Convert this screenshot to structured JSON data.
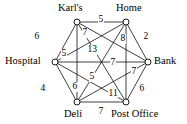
{
  "diagram": {
    "type": "weighted-graph",
    "vertex_count": 6,
    "edge_count": 15,
    "colors": {
      "background": "#ffffff",
      "stroke": "#000000",
      "vertex_fill": "#ffffff",
      "text": "#000000"
    },
    "nodes": [
      {
        "id": "karls",
        "label": "Karl's",
        "cx": 77,
        "cy": 22,
        "label_x": 58,
        "label_y": 3,
        "label_anchor": "left"
      },
      {
        "id": "home",
        "label": "Home",
        "cx": 126,
        "cy": 22,
        "label_x": 116,
        "label_y": 3,
        "label_anchor": "left"
      },
      {
        "id": "hospital",
        "label": "Hospital",
        "cx": 55,
        "cy": 62,
        "label_x": 5,
        "label_y": 56,
        "label_anchor": "left"
      },
      {
        "id": "bank",
        "label": "Bank",
        "cx": 148,
        "cy": 62,
        "label_x": 154,
        "label_y": 56,
        "label_anchor": "left"
      },
      {
        "id": "deli",
        "label": "Deli",
        "cx": 77,
        "cy": 102,
        "label_x": 64,
        "label_y": 109,
        "label_anchor": "left"
      },
      {
        "id": "postoffice",
        "label": "Post Office",
        "cx": 126,
        "cy": 102,
        "label_x": 111,
        "label_y": 109,
        "label_anchor": "left"
      }
    ],
    "edges": [
      {
        "id": "karls-home",
        "from": "karls",
        "to": "home",
        "weight": "5",
        "label_x": 98,
        "label_y": 15
      },
      {
        "id": "karls-hospital",
        "from": "karls",
        "to": "hospital",
        "weight": "6",
        "label_x": 34,
        "label_y": 32
      },
      {
        "id": "home-bank",
        "from": "home",
        "to": "bank",
        "weight": "2",
        "label_x": 143,
        "label_y": 32
      },
      {
        "id": "hospital-bank",
        "from": "hospital",
        "to": "bank",
        "weight": "7",
        "label_x": 110,
        "label_y": 58
      },
      {
        "id": "hospital-deli",
        "from": "hospital",
        "to": "deli",
        "weight": "4",
        "label_x": 40,
        "label_y": 84
      },
      {
        "id": "deli-postoffice",
        "from": "deli",
        "to": "postoffice",
        "weight": "7",
        "label_x": 98,
        "label_y": 107
      },
      {
        "id": "bank-postoffice",
        "from": "bank",
        "to": "postoffice",
        "weight": "6",
        "label_x": 139,
        "label_y": 84
      },
      {
        "id": "home-postoffice",
        "from": "home",
        "to": "postoffice",
        "weight": "8",
        "label_x": 120,
        "label_y": 34
      },
      {
        "id": "karls-deli",
        "from": "karls",
        "to": "deli",
        "weight": "6",
        "label_x": 72,
        "label_y": 82
      },
      {
        "id": "hospital-home",
        "from": "hospital",
        "to": "home",
        "weight": "5",
        "label_x": 61,
        "label_y": 49
      },
      {
        "id": "karls-bank",
        "from": "karls",
        "to": "bank",
        "weight": "7",
        "label_x": 82,
        "label_y": 28
      },
      {
        "id": "karls-postoffice",
        "from": "karls",
        "to": "postoffice",
        "weight": "13",
        "label_x": 87,
        "label_y": 45
      },
      {
        "id": "hospital-postoffice",
        "from": "hospital",
        "to": "postoffice",
        "weight": "5",
        "label_x": 89,
        "label_y": 72
      },
      {
        "id": "deli-home",
        "from": "deli",
        "to": "home",
        "weight": "11",
        "label_x": 108,
        "label_y": 89
      },
      {
        "id": "deli-bank",
        "from": "deli",
        "to": "bank",
        "weight": "7",
        "label_x": 131,
        "label_y": 67
      }
    ]
  }
}
